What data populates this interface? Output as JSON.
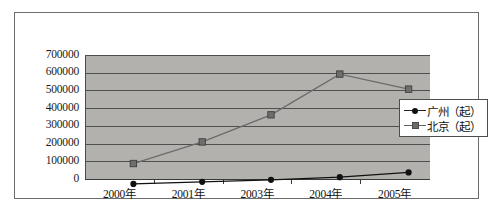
{
  "chart_data": {
    "type": "line",
    "title": "",
    "subtitle": "",
    "xlabel": "",
    "ylabel": "",
    "categories": [
      "2000年",
      "2001年",
      "2003年",
      "2004年",
      "2005年"
    ],
    "series": [
      {
        "name": "广州（起）",
        "marker": "diamond",
        "color": "#111111",
        "values": [
          40000,
          52000,
          63000,
          78000,
          105000
        ]
      },
      {
        "name": "北京（起）",
        "marker": "square",
        "color": "#6b6b6b",
        "values": [
          155000,
          277000,
          430000,
          660000,
          575000
        ]
      }
    ],
    "ylim": [
      0,
      700000
    ],
    "ytick_labels": [
      "700000",
      "600000",
      "500000",
      "400000",
      "300000",
      "200000",
      "100000",
      "0"
    ],
    "ytick_values": [
      700000,
      600000,
      500000,
      400000,
      300000,
      200000,
      100000,
      0
    ],
    "grid": true,
    "legend_position": "right",
    "plot_background": "#b3b1ad",
    "figure_background": "#ffffff"
  },
  "legend": {
    "items": [
      {
        "label": "广州（起）",
        "key_name": "legend-key-guangzhou"
      },
      {
        "label": "北京（起）",
        "key_name": "legend-key-beijing"
      }
    ]
  }
}
